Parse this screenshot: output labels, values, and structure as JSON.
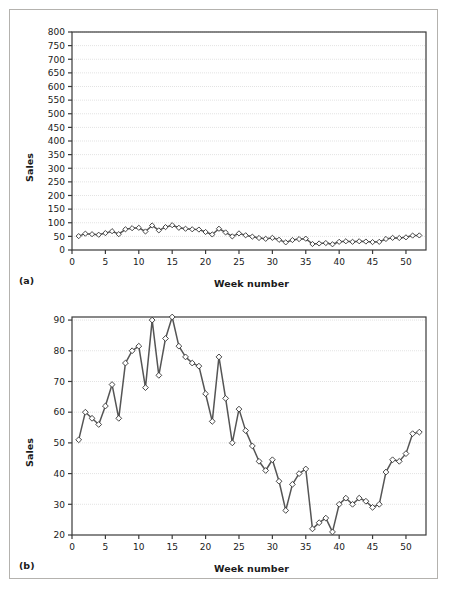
{
  "figure": {
    "panel_a_label": "(a)",
    "panel_b_label": "(b)",
    "border_color": "#b4b2ae",
    "line_color": "#555555",
    "marker_fill": "#ffffff",
    "marker_stroke": "#333333",
    "axis_color": "#3a3a3a",
    "grid_color": "#e3e3e3"
  },
  "chart_data": [
    {
      "type": "line",
      "title": "",
      "panel": "(a)",
      "xlabel": "Week number",
      "ylabel": "Sales",
      "xlim": [
        0,
        53
      ],
      "ylim": [
        0,
        800
      ],
      "ytick_step": 50,
      "xtick_step": 5,
      "xticks": [
        0,
        5,
        10,
        15,
        20,
        25,
        30,
        35,
        40,
        45,
        50
      ],
      "yticks": [
        0,
        50,
        100,
        150,
        200,
        250,
        300,
        350,
        400,
        450,
        500,
        550,
        600,
        650,
        700,
        750,
        800
      ],
      "grid": true,
      "legend": "none",
      "marker": "diamond",
      "x": [
        1,
        2,
        3,
        4,
        5,
        6,
        7,
        8,
        9,
        10,
        11,
        12,
        13,
        14,
        15,
        16,
        17,
        18,
        19,
        20,
        21,
        22,
        23,
        24,
        25,
        26,
        27,
        28,
        29,
        30,
        31,
        32,
        33,
        34,
        35,
        36,
        37,
        38,
        39,
        40,
        41,
        42,
        43,
        44,
        45,
        46,
        47,
        48,
        49,
        50,
        51,
        52
      ],
      "series": [
        {
          "name": "Sales",
          "values": [
            51,
            60,
            58,
            56,
            62,
            69,
            58,
            76,
            80,
            81.5,
            68,
            90,
            72,
            84,
            91,
            81.5,
            78,
            76,
            75,
            66,
            57,
            78,
            64.5,
            50,
            61,
            54,
            49,
            44,
            41,
            44.5,
            37.5,
            28,
            36.5,
            40,
            41.5,
            22,
            24,
            25.5,
            21,
            30,
            32,
            30,
            32,
            31,
            29,
            30,
            40.5,
            44.5,
            44,
            46.5,
            53,
            53.5
          ]
        }
      ],
      "note": "Same data as panel (b) but drawn on an inflated 0-800 axis, so the series appears almost flat near the bottom."
    },
    {
      "type": "line",
      "title": "",
      "panel": "(b)",
      "xlabel": "Week number",
      "ylabel": "Sales",
      "xlim": [
        0,
        53
      ],
      "ylim": [
        20,
        91
      ],
      "ytick_step": 10,
      "xtick_step": 5,
      "xticks": [
        0,
        5,
        10,
        15,
        20,
        25,
        30,
        35,
        40,
        45,
        50
      ],
      "yticks": [
        20,
        30,
        40,
        50,
        60,
        70,
        80,
        90
      ],
      "grid": true,
      "legend": "none",
      "marker": "diamond",
      "x": [
        1,
        2,
        3,
        4,
        5,
        6,
        7,
        8,
        9,
        10,
        11,
        12,
        13,
        14,
        15,
        16,
        17,
        18,
        19,
        20,
        21,
        22,
        23,
        24,
        25,
        26,
        27,
        28,
        29,
        30,
        31,
        32,
        33,
        34,
        35,
        36,
        37,
        38,
        39,
        40,
        41,
        42,
        43,
        44,
        45,
        46,
        47,
        48,
        49,
        50,
        51,
        52
      ],
      "series": [
        {
          "name": "Sales",
          "values": [
            51,
            60,
            58,
            56,
            62,
            69,
            58,
            76,
            80,
            81.5,
            68,
            90,
            72,
            84,
            91,
            81.5,
            78,
            76,
            75,
            66,
            57,
            78,
            64.5,
            50,
            61,
            54,
            49,
            44,
            41,
            44.5,
            37.5,
            28,
            36.5,
            40,
            41.5,
            22,
            24,
            25.5,
            21,
            30,
            32,
            30,
            32,
            31,
            29,
            30,
            40.5,
            44.5,
            44,
            46.5,
            53,
            53.5
          ]
        }
      ],
      "note": "Same data as panel (a) on a zoomed 20-90 axis revealing a rise to week 15 then a decline and recovery."
    }
  ]
}
